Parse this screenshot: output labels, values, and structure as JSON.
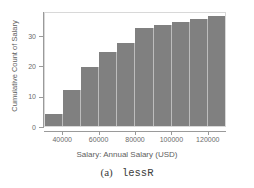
{
  "chart_data": {
    "type": "bar",
    "title": "",
    "xlabel": "Salary: Annual Salary (USD)",
    "ylabel": "Cumulative Count of Salary",
    "categories": [
      "30000-40000",
      "40000-50000",
      "50000-60000",
      "60000-70000",
      "70000-80000",
      "80000-90000",
      "90000-100000",
      "100000-110000",
      "110000-120000",
      "120000-130000"
    ],
    "bin_starts": [
      30000,
      40000,
      50000,
      60000,
      70000,
      80000,
      90000,
      100000,
      110000,
      120000
    ],
    "bin_width": 10000,
    "values": [
      4,
      12,
      20,
      25,
      28,
      33,
      34,
      35,
      36,
      37
    ],
    "xlim": [
      30000,
      130000
    ],
    "ylim": [
      0,
      38
    ],
    "y_ticks": [
      0,
      10,
      20,
      30
    ],
    "y_tick_labels": [
      "0",
      "10",
      "20",
      "30"
    ],
    "x_ticks": [
      40000,
      60000,
      80000,
      100000,
      120000
    ],
    "x_tick_labels": [
      "40000",
      "60000",
      "80000",
      "100000",
      "120000"
    ],
    "grid": false,
    "legend": null,
    "bar_color": "#808080",
    "bar_edge_color": "#bdbdbd",
    "frame_color": "#d8d8d8",
    "axis_color": "#9a9a9a",
    "background": "#ffffff"
  },
  "caption": {
    "index": "(a)",
    "name": "lessR"
  }
}
